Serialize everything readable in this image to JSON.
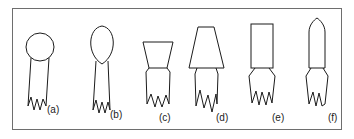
{
  "figure": {
    "caption_labels": [
      "(a)",
      "(b)",
      "(c)",
      "(d)",
      "(e)",
      "(f)"
    ],
    "frame": {
      "border_color": "#6e6e6e",
      "background_color": "#ffffff",
      "x": 12,
      "y": 8,
      "width": 330,
      "height": 122
    },
    "stroke_color": "#1b1b1b",
    "panels": [
      {
        "id": "a",
        "label": "(a)",
        "head_shape": "circle",
        "description": "circular head on tapered stem with jagged base",
        "label_x": 47,
        "label_y": 113
      },
      {
        "id": "b",
        "label": "(b)",
        "head_shape": "teardrop",
        "description": "teardrop head pointed downward on stem with jagged base",
        "label_x": 110,
        "label_y": 118
      },
      {
        "id": "c",
        "label": "(c)",
        "head_shape": "inverted-trapezoid",
        "description": "wide-top trapezoid head on stem with jagged base",
        "label_x": 159,
        "label_y": 121
      },
      {
        "id": "d",
        "label": "(d)",
        "head_shape": "tall-trapezoid",
        "description": "narrow-top tall trapezoid head on stem with jagged base",
        "label_x": 216,
        "label_y": 121
      },
      {
        "id": "e",
        "label": "(e)",
        "head_shape": "rectangle",
        "description": "rectangular head on stem with jagged base",
        "label_x": 272,
        "label_y": 121
      },
      {
        "id": "f",
        "label": "(f)",
        "head_shape": "ogive",
        "description": "pointed bullet head on stem with jagged base",
        "label_x": 328,
        "label_y": 121
      }
    ]
  }
}
